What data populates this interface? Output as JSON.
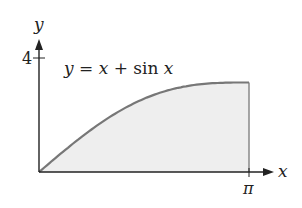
{
  "chart_data": {
    "type": "area",
    "title": "",
    "function_label": "y = x + sin x",
    "function_label_parts": {
      "lhs": "y",
      "eq": " = ",
      "x1": "x",
      "plus": " + ",
      "sin": "sin ",
      "x2": "x"
    },
    "xlabel": "x",
    "ylabel": "y",
    "x_ticks": [
      {
        "value": 3.14159,
        "label": "π"
      }
    ],
    "y_ticks": [
      {
        "value": 4,
        "label": "4"
      }
    ],
    "xlim": [
      0,
      3.14159
    ],
    "ylim": [
      0,
      4
    ],
    "grid": false,
    "legend": "none",
    "shaded_region": "area under curve from x=0 to x=π",
    "x": [
      0,
      0.3927,
      0.7854,
      1.1781,
      1.5708,
      1.9635,
      2.3562,
      2.7489,
      3.14159
    ],
    "y": [
      0,
      0.775,
      1.492,
      2.102,
      2.571,
      2.887,
      3.063,
      3.132,
      3.14159
    ],
    "colors": {
      "curve": "#777777",
      "fill": "#eeeeee",
      "axes": "#222222"
    }
  }
}
